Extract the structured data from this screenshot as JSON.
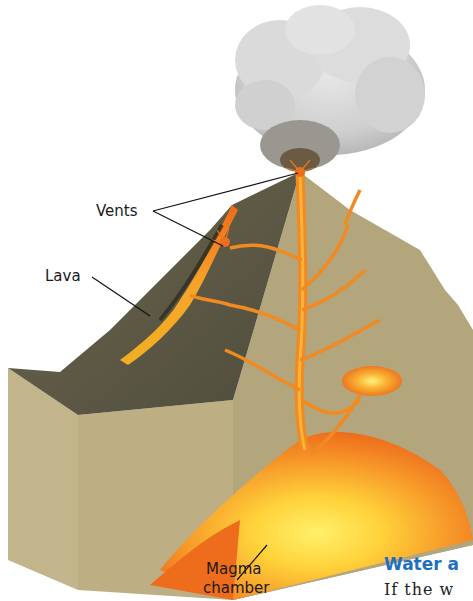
{
  "figure": {
    "labels": {
      "vents": "Vents",
      "lava": "Lava",
      "magma_line1": "Magma",
      "magma_line2": "chamber"
    }
  },
  "text_fragment": {
    "heading": "Water a",
    "body": "If the w",
    "heading_color": "#1f6fc0"
  },
  "colors": {
    "rock": "#b3a57c",
    "rock_side": "#bfb084",
    "lava_orange": "#f07c1c",
    "magma_yellow": "#ffd93a",
    "ash_cloud": "#d4d4d4",
    "slope_dark": "#5e5a48"
  }
}
